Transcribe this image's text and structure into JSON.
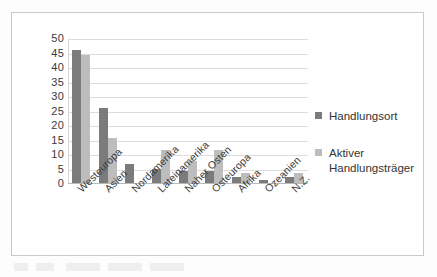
{
  "chart_data": {
    "type": "bar",
    "title": "",
    "xlabel": "",
    "ylabel": "",
    "ylim": [
      0,
      50
    ],
    "ytick_step": 5,
    "grid": true,
    "legend_position": "right",
    "categories": [
      "Westeuropa",
      "Asien",
      "Nordamerika",
      "Lateinamerika",
      "Naher Osten",
      "Osteuropa",
      "Afrika",
      "Ozeanien",
      "N.Z."
    ],
    "ytick_labels": [
      "0",
      "5",
      "10",
      "15",
      "20",
      "25",
      "30",
      "35",
      "40",
      "45",
      "50"
    ],
    "series": [
      {
        "name": "Handlungsort",
        "color": "#7b7b7b",
        "values": [
          46,
          26,
          6.5,
          5,
          4,
          4,
          2,
          1,
          2
        ]
      },
      {
        "name": "Aktiver Handlungsträger",
        "color": "#bdbdbd",
        "values": [
          44,
          15.5,
          0,
          11.5,
          7.5,
          11.5,
          3.5,
          0,
          3.5
        ]
      }
    ]
  },
  "legend": {
    "entries": [
      {
        "label": "Handlungsort"
      },
      {
        "label": "Aktiver Handlungsträger"
      }
    ]
  },
  "colors": {
    "series_dark": "#7b7b7b",
    "series_light": "#bdbdbd",
    "frame_border": "#c9c9c9",
    "gridline": "#dcdcdc",
    "text": "#3a3a3a"
  }
}
